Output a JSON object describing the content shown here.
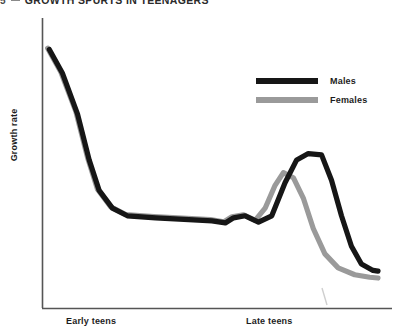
{
  "title": {
    "number": "5",
    "separator": "-",
    "index": "2",
    "text": "GROWTH SPURTS IN TEENAGERS",
    "full": "5-2 GROWTH SPURTS IN TEENAGERS"
  },
  "axes": {
    "ylabel": "Growth rate",
    "xlabel_left": "Early teens",
    "xlabel_right": "Late teens",
    "axis_color": "#555555"
  },
  "legend": {
    "position": "top-right",
    "entries": [
      {
        "label": "Males",
        "color": "#161616"
      },
      {
        "label": "Females",
        "color": "#9a9a9a"
      }
    ]
  },
  "colors": {
    "males": "#161616",
    "females": "#9a9a9a",
    "axis": "#555555",
    "background": "#ffffff",
    "title_text": "#2b2b2b"
  },
  "chart_data": {
    "type": "line",
    "subtitle": "",
    "xlabel": "",
    "ylabel": "Growth rate",
    "xtick_labels": [
      "Early teens",
      "Late teens"
    ],
    "xtick_positions": [
      0.18,
      0.68
    ],
    "ytick_labels": [],
    "grid": false,
    "legend_position": "top-right",
    "xlim": [
      0,
      1
    ],
    "ylim": [
      0,
      1
    ],
    "axis_note": "Axes are unlabeled/qualitative: growth rate vs. age through the teenage years.",
    "annotations": [
      "Both sexes start with a high growth rate in early childhood that falls steeply.",
      "Growth rate plateaus at a low level through the early teens.",
      "Females show an earlier, smaller growth spurt than males.",
      "Males show a later, larger growth spurt, then both decline to near zero."
    ],
    "series": [
      {
        "name": "Males",
        "color": "#161616",
        "points": [
          [
            0.01,
            0.955
          ],
          [
            0.05,
            0.86
          ],
          [
            0.095,
            0.7
          ],
          [
            0.13,
            0.52
          ],
          [
            0.16,
            0.4
          ],
          [
            0.2,
            0.33
          ],
          [
            0.245,
            0.3
          ],
          [
            0.33,
            0.292
          ],
          [
            0.43,
            0.285
          ],
          [
            0.5,
            0.28
          ],
          [
            0.54,
            0.272
          ],
          [
            0.565,
            0.292
          ],
          [
            0.6,
            0.3
          ],
          [
            0.64,
            0.275
          ],
          [
            0.68,
            0.3
          ],
          [
            0.72,
            0.43
          ],
          [
            0.755,
            0.52
          ],
          [
            0.79,
            0.545
          ],
          [
            0.83,
            0.54
          ],
          [
            0.86,
            0.44
          ],
          [
            0.89,
            0.3
          ],
          [
            0.92,
            0.18
          ],
          [
            0.95,
            0.11
          ],
          [
            0.985,
            0.085
          ],
          [
            1.0,
            0.082
          ]
        ]
      },
      {
        "name": "Females",
        "color": "#9a9a9a",
        "points": [
          [
            0.005,
            0.96
          ],
          [
            0.045,
            0.865
          ],
          [
            0.09,
            0.71
          ],
          [
            0.125,
            0.53
          ],
          [
            0.155,
            0.405
          ],
          [
            0.195,
            0.335
          ],
          [
            0.24,
            0.305
          ],
          [
            0.325,
            0.297
          ],
          [
            0.425,
            0.29
          ],
          [
            0.495,
            0.285
          ],
          [
            0.535,
            0.276
          ],
          [
            0.56,
            0.296
          ],
          [
            0.595,
            0.304
          ],
          [
            0.63,
            0.282
          ],
          [
            0.66,
            0.33
          ],
          [
            0.69,
            0.42
          ],
          [
            0.715,
            0.47
          ],
          [
            0.745,
            0.45
          ],
          [
            0.775,
            0.37
          ],
          [
            0.805,
            0.25
          ],
          [
            0.84,
            0.15
          ],
          [
            0.88,
            0.095
          ],
          [
            0.93,
            0.068
          ],
          [
            0.975,
            0.058
          ],
          [
            1.0,
            0.055
          ]
        ]
      }
    ]
  }
}
